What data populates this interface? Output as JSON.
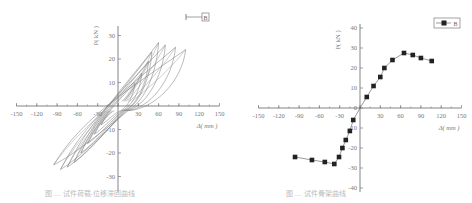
{
  "chart_data": [
    {
      "type": "line",
      "title": "",
      "description": "Load-displacement hysteresis loops (multiple cycles)",
      "xlabel": "Δ( mm )",
      "ylabel": "P( kN )",
      "xlim": [
        -150,
        150
      ],
      "ylim": [
        -35,
        35
      ],
      "xticks": [
        -150,
        -120,
        -90,
        -60,
        -30,
        0,
        30,
        60,
        90,
        120,
        150
      ],
      "yticks": [
        -30,
        -20,
        -10,
        10,
        20,
        30
      ],
      "legend": [
        {
          "name": "B",
          "marker": "none"
        }
      ],
      "legend_position": "upper right",
      "grid": false,
      "series": [
        {
          "name": "B",
          "loops": [
            {
              "x": [
                -25,
                0,
                25
              ],
              "y": [
                -8,
                0,
                10
              ]
            },
            {
              "x": [
                -35,
                0,
                35
              ],
              "y": [
                -12,
                0,
                14
              ]
            },
            {
              "x": [
                -45,
                0,
                45
              ],
              "y": [
                -16,
                0,
                19
              ]
            },
            {
              "x": [
                -55,
                0,
                50
              ],
              "y": [
                -20,
                0,
                23
              ]
            },
            {
              "x": [
                -65,
                0,
                60
              ],
              "y": [
                -24,
                0,
                27
              ]
            },
            {
              "x": [
                -75,
                0,
                70
              ],
              "y": [
                -26,
                0,
                26
              ]
            },
            {
              "x": [
                -85,
                0,
                85
              ],
              "y": [
                -27,
                0,
                25
              ]
            },
            {
              "x": [
                -95,
                0,
                100
              ],
              "y": [
                -25,
                0,
                24
              ]
            }
          ]
        }
      ]
    },
    {
      "type": "line",
      "title": "",
      "description": "Skeleton curve",
      "xlabel": "Δ( mm )",
      "ylabel": "P( kN )",
      "xlim": [
        -150,
        150
      ],
      "ylim": [
        -40,
        40
      ],
      "xticks": [
        -150,
        -120,
        -90,
        -60,
        -30,
        0,
        30,
        60,
        90,
        120,
        150
      ],
      "yticks": [
        -40,
        -30,
        -20,
        -10,
        0,
        10,
        20,
        30,
        40
      ],
      "legend": [
        {
          "name": "B",
          "marker": "square"
        }
      ],
      "legend_position": "upper right",
      "grid": false,
      "series": [
        {
          "name": "B",
          "x": [
            -96,
            -71,
            -52,
            -38,
            -31,
            -26,
            -21,
            -15,
            -10,
            0,
            10,
            20,
            30,
            36,
            48,
            65,
            78,
            90,
            106
          ],
          "y": [
            -24.5,
            -26,
            -27,
            -28,
            -24.5,
            -20,
            -16,
            -11.5,
            -6,
            0,
            5.5,
            11,
            15.5,
            20,
            24,
            27.5,
            26.5,
            25,
            23.5
          ]
        }
      ]
    }
  ],
  "captions": {
    "left": "图 … 试件荷载-位移滞回曲线",
    "right": "图 … 试件骨架曲线"
  }
}
